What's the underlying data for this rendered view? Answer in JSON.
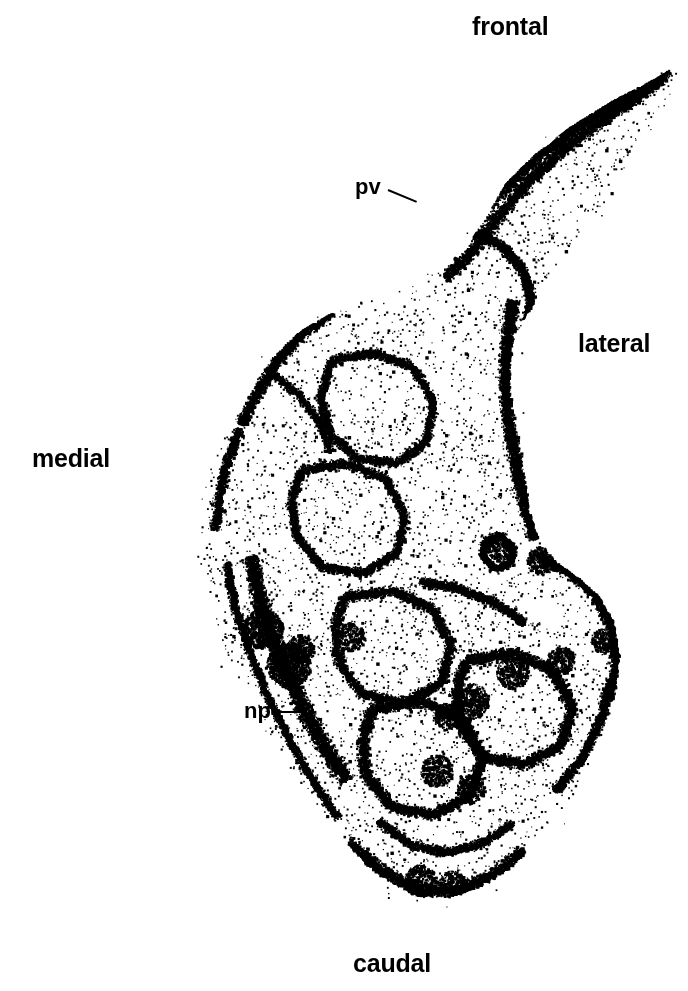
{
  "figure": {
    "kind": "autoradiograph-stipple-section",
    "width": 688,
    "height": 991,
    "background_color": "#ffffff",
    "stipple_color": "#000000"
  },
  "orientation_labels": [
    {
      "id": "frontal",
      "text": "frontal",
      "x": 472,
      "y": 14
    },
    {
      "id": "lateral",
      "text": "lateral",
      "x": 578,
      "y": 331
    },
    {
      "id": "medial",
      "text": "medial",
      "x": 32,
      "y": 446
    },
    {
      "id": "caudal",
      "text": "caudal",
      "x": 353,
      "y": 951
    }
  ],
  "structure_labels": [
    {
      "id": "pv",
      "text": "pv",
      "x": 355,
      "y": 176,
      "leader": {
        "x1": 388,
        "y1": 189,
        "x2": 417,
        "y2": 201
      }
    },
    {
      "id": "np",
      "text": "np",
      "x": 244,
      "y": 700,
      "leader": {
        "x1": 277,
        "y1": 711,
        "x2": 301,
        "y2": 711
      }
    }
  ],
  "chart_data": {
    "type": "scatter",
    "title": "",
    "xlabel": "",
    "ylabel": "",
    "xlim": [
      0,
      688
    ],
    "ylim": [
      0,
      991
    ],
    "grid": false,
    "legend": null,
    "outline": [
      [
        680,
        62
      ],
      [
        655,
        78
      ],
      [
        612,
        100
      ],
      [
        570,
        126
      ],
      [
        533,
        155
      ],
      [
        505,
        183
      ],
      [
        487,
        214
      ],
      [
        468,
        243
      ],
      [
        444,
        267
      ],
      [
        410,
        286
      ],
      [
        372,
        300
      ],
      [
        332,
        312
      ],
      [
        300,
        330
      ],
      [
        272,
        356
      ],
      [
        250,
        388
      ],
      [
        232,
        420
      ],
      [
        216,
        452
      ],
      [
        204,
        486
      ],
      [
        196,
        520
      ],
      [
        196,
        556
      ],
      [
        204,
        592
      ],
      [
        216,
        628
      ],
      [
        230,
        664
      ],
      [
        248,
        700
      ],
      [
        268,
        736
      ],
      [
        292,
        772
      ],
      [
        318,
        806
      ],
      [
        344,
        840
      ],
      [
        370,
        868
      ],
      [
        396,
        888
      ],
      [
        424,
        898
      ],
      [
        452,
        896
      ],
      [
        482,
        884
      ],
      [
        512,
        864
      ],
      [
        540,
        836
      ],
      [
        566,
        804
      ],
      [
        588,
        768
      ],
      [
        604,
        730
      ],
      [
        614,
        692
      ],
      [
        618,
        654
      ],
      [
        612,
        620
      ],
      [
        598,
        596
      ],
      [
        578,
        578
      ],
      [
        556,
        562
      ],
      [
        538,
        540
      ],
      [
        528,
        512
      ],
      [
        524,
        480
      ],
      [
        520,
        448
      ],
      [
        514,
        416
      ],
      [
        508,
        384
      ],
      [
        510,
        352
      ],
      [
        524,
        316
      ],
      [
        548,
        276
      ],
      [
        578,
        236
      ],
      [
        610,
        196
      ],
      [
        640,
        152
      ],
      [
        664,
        110
      ],
      [
        680,
        62
      ]
    ],
    "dense_ridges": [
      {
        "name": "frontal-dorsal-band",
        "points": [
          [
            668,
            70
          ],
          [
            620,
            98
          ],
          [
            575,
            126
          ],
          [
            535,
            156
          ],
          [
            500,
            190
          ],
          [
            472,
            224
          ],
          [
            448,
            254
          ]
        ],
        "width": 16,
        "density": 0.95
      },
      {
        "name": "frontal-ventral-band",
        "points": [
          [
            660,
            80
          ],
          [
            612,
            112
          ],
          [
            568,
            144
          ],
          [
            528,
            180
          ],
          [
            496,
            218
          ],
          [
            470,
            252
          ],
          [
            444,
            278
          ]
        ],
        "width": 13,
        "density": 0.8
      },
      {
        "name": "pv-ring",
        "points": [
          [
            398,
            212
          ],
          [
            420,
            202
          ],
          [
            444,
            208
          ],
          [
            456,
            228
          ],
          [
            448,
            252
          ],
          [
            424,
            262
          ],
          [
            402,
            252
          ],
          [
            392,
            232
          ],
          [
            398,
            212
          ]
        ],
        "width": 14,
        "density": 1.0
      },
      {
        "name": "upper-lobule-arc-1",
        "points": [
          [
            470,
            230
          ],
          [
            500,
            244
          ],
          [
            522,
            268
          ],
          [
            530,
            298
          ],
          [
            524,
            330
          ]
        ],
        "width": 11,
        "density": 0.85
      },
      {
        "name": "mid-lateral-spine",
        "points": [
          [
            512,
            300
          ],
          [
            506,
            340
          ],
          [
            504,
            382
          ],
          [
            508,
            424
          ],
          [
            516,
            466
          ],
          [
            524,
            504
          ],
          [
            534,
            538
          ]
        ],
        "width": 14,
        "density": 0.95
      },
      {
        "name": "medial-upper-edge",
        "points": [
          [
            330,
            312
          ],
          [
            300,
            334
          ],
          [
            276,
            360
          ],
          [
            256,
            392
          ],
          [
            240,
            424
          ]
        ],
        "width": 12,
        "density": 0.8
      },
      {
        "name": "medial-mid-edge",
        "points": [
          [
            238,
            428
          ],
          [
            226,
            462
          ],
          [
            218,
            496
          ],
          [
            214,
            530
          ]
        ],
        "width": 11,
        "density": 0.75
      },
      {
        "name": "np-band",
        "points": [
          [
            250,
            556
          ],
          [
            258,
            596
          ],
          [
            270,
            634
          ],
          [
            286,
            672
          ],
          [
            304,
            710
          ],
          [
            324,
            746
          ],
          [
            346,
            780
          ]
        ],
        "width": 18,
        "density": 1.0
      },
      {
        "name": "np-outer-rim",
        "points": [
          [
            226,
            562
          ],
          [
            234,
            606
          ],
          [
            248,
            650
          ],
          [
            266,
            694
          ],
          [
            288,
            738
          ],
          [
            312,
            780
          ],
          [
            338,
            818
          ]
        ],
        "width": 9,
        "density": 0.7
      },
      {
        "name": "central-lobule-1",
        "points": [
          [
            330,
            360
          ],
          [
            372,
            352
          ],
          [
            412,
            366
          ],
          [
            432,
            400
          ],
          [
            426,
            440
          ],
          [
            396,
            462
          ],
          [
            356,
            458
          ],
          [
            328,
            432
          ],
          [
            320,
            396
          ],
          [
            330,
            360
          ]
        ],
        "width": 10,
        "density": 0.7
      },
      {
        "name": "central-lobule-2",
        "points": [
          [
            300,
            470
          ],
          [
            344,
            462
          ],
          [
            384,
            478
          ],
          [
            404,
            514
          ],
          [
            396,
            552
          ],
          [
            362,
            572
          ],
          [
            320,
            566
          ],
          [
            296,
            536
          ],
          [
            290,
            500
          ],
          [
            300,
            470
          ]
        ],
        "width": 10,
        "density": 0.72
      },
      {
        "name": "central-lobule-3",
        "points": [
          [
            344,
            596
          ],
          [
            392,
            590
          ],
          [
            432,
            608
          ],
          [
            450,
            644
          ],
          [
            440,
            682
          ],
          [
            404,
            702
          ],
          [
            362,
            694
          ],
          [
            338,
            662
          ],
          [
            334,
            624
          ],
          [
            344,
            596
          ]
        ],
        "width": 11,
        "density": 0.78
      },
      {
        "name": "caudal-lobule-1",
        "points": [
          [
            372,
            708
          ],
          [
            420,
            700
          ],
          [
            462,
            718
          ],
          [
            482,
            756
          ],
          [
            470,
            794
          ],
          [
            432,
            814
          ],
          [
            390,
            806
          ],
          [
            364,
            772
          ],
          [
            362,
            736
          ],
          [
            372,
            708
          ]
        ],
        "width": 12,
        "density": 0.85
      },
      {
        "name": "caudal-lobule-2",
        "points": [
          [
            466,
            660
          ],
          [
            512,
            652
          ],
          [
            552,
            670
          ],
          [
            572,
            706
          ],
          [
            560,
            744
          ],
          [
            524,
            764
          ],
          [
            482,
            756
          ],
          [
            458,
            722
          ],
          [
            456,
            686
          ],
          [
            466,
            660
          ]
        ],
        "width": 12,
        "density": 0.88
      },
      {
        "name": "lateral-bulge-rim",
        "points": [
          [
            540,
            556
          ],
          [
            570,
            572
          ],
          [
            596,
            596
          ],
          [
            612,
            628
          ],
          [
            616,
            664
          ],
          [
            608,
            700
          ]
        ],
        "width": 13,
        "density": 0.9
      },
      {
        "name": "small-islet",
        "points": [
          [
            484,
            540
          ],
          [
            500,
            534
          ],
          [
            512,
            546
          ],
          [
            510,
            562
          ],
          [
            494,
            568
          ],
          [
            482,
            556
          ],
          [
            484,
            540
          ]
        ],
        "width": 7,
        "density": 0.9
      },
      {
        "name": "caudal-bottom-arc",
        "points": [
          [
            348,
            842
          ],
          [
            384,
            872
          ],
          [
            420,
            890
          ],
          [
            456,
            890
          ],
          [
            492,
            874
          ],
          [
            524,
            850
          ]
        ],
        "width": 14,
        "density": 0.9
      },
      {
        "name": "caudal-inner-arc",
        "points": [
          [
            378,
            820
          ],
          [
            410,
            844
          ],
          [
            446,
            852
          ],
          [
            482,
            842
          ],
          [
            512,
            822
          ]
        ],
        "width": 10,
        "density": 0.75
      },
      {
        "name": "lateral-lower-rim",
        "points": [
          [
            554,
            790
          ],
          [
            582,
            756
          ],
          [
            600,
            718
          ],
          [
            610,
            678
          ]
        ],
        "width": 10,
        "density": 0.8
      },
      {
        "name": "mid-cross-band",
        "points": [
          [
            420,
            580
          ],
          [
            458,
            588
          ],
          [
            494,
            602
          ],
          [
            524,
            622
          ]
        ],
        "width": 10,
        "density": 0.82
      },
      {
        "name": "upper-medial-ridge",
        "points": [
          [
            268,
            370
          ],
          [
            296,
            392
          ],
          [
            318,
            420
          ],
          [
            330,
            452
          ]
        ],
        "width": 9,
        "density": 0.65
      }
    ],
    "diffuse_regions": [
      {
        "name": "frontal-tail",
        "bbox": [
          470,
          60,
          690,
          270
        ],
        "density": 0.3
      },
      {
        "name": "upper-body",
        "bbox": [
          270,
          250,
          545,
          470
        ],
        "density": 0.42
      },
      {
        "name": "mid-body",
        "bbox": [
          205,
          420,
          560,
          660
        ],
        "density": 0.45
      },
      {
        "name": "caudal-body",
        "bbox": [
          250,
          620,
          625,
          900
        ],
        "density": 0.48
      }
    ]
  }
}
